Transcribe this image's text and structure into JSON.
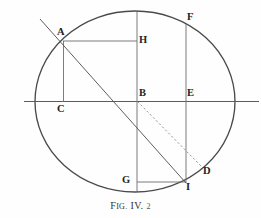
{
  "figure": {
    "caption": {
      "prefix_first": "F",
      "prefix_rest": "IG.",
      "roman": "IV.",
      "number": "2",
      "full_text": "FIG. IV. 2"
    },
    "colors": {
      "background": "#fefefe",
      "ink": "#3a3a3a",
      "ink_dark": "#232323",
      "circle_stroke": "#444444",
      "thin_stroke": "#6e6e6e",
      "dashed_stroke": "#8a8a8a"
    },
    "geometry": {
      "circle": {
        "cx": 135,
        "cy": 101,
        "rx": 100,
        "ry": 90
      },
      "diameter_line": {
        "x1": 24,
        "y1": 101,
        "x2": 258,
        "y2": 101
      },
      "vertical_diameter": {
        "x1": 137,
        "y1": 11,
        "x2": 137,
        "y2": 192
      }
    },
    "points": [
      {
        "id": "A",
        "label": "A",
        "x": 63,
        "y": 41,
        "label_x": 58,
        "label_y": 28
      },
      {
        "id": "B",
        "label": "B",
        "x": 137,
        "y": 101,
        "label_x": 139,
        "label_y": 89
      },
      {
        "id": "C",
        "label": "C",
        "x": 63,
        "y": 101,
        "label_x": 58,
        "label_y": 105
      },
      {
        "id": "D",
        "label": "D",
        "x": 203,
        "y": 168,
        "label_x": 205,
        "label_y": 168
      },
      {
        "id": "E",
        "label": "E",
        "x": 186,
        "y": 101,
        "label_x": 187,
        "label_y": 89
      },
      {
        "id": "F",
        "label": "F",
        "x": 186,
        "y": 24,
        "label_x": 187,
        "label_y": 12
      },
      {
        "id": "G",
        "label": "G",
        "x": 137,
        "y": 182,
        "label_x": 123,
        "label_y": 176
      },
      {
        "id": "H",
        "label": "H",
        "x": 137,
        "y": 41,
        "label_x": 139,
        "label_y": 35
      },
      {
        "id": "I",
        "label": "I",
        "x": 186,
        "y": 182,
        "label_x": 187,
        "label_y": 183
      }
    ],
    "segments": [
      {
        "name": "horizontal-diameter",
        "from": "left-edge",
        "to": "right-edge",
        "style": "solid"
      },
      {
        "name": "vertical-diameter",
        "from": "top",
        "to": "bottom",
        "style": "solid"
      },
      {
        "name": "segment-AC",
        "from": "A",
        "to": "C",
        "style": "solid"
      },
      {
        "name": "segment-AH",
        "from": "A",
        "to": "H",
        "style": "solid"
      },
      {
        "name": "segment-FE-I",
        "from": "F",
        "to": "I",
        "style": "solid"
      },
      {
        "name": "segment-GI",
        "from": "G",
        "to": "I",
        "style": "solid"
      },
      {
        "name": "segment-AB-extended",
        "from": "A",
        "to": "I",
        "style": "solid"
      },
      {
        "name": "segment-BD",
        "from": "B",
        "to": "D",
        "style": "dashed"
      }
    ]
  }
}
